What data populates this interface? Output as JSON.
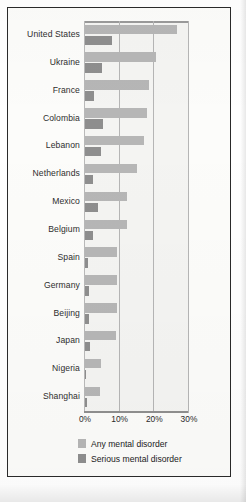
{
  "chart_data": {
    "type": "bar",
    "orientation": "horizontal",
    "title": "",
    "xlabel": "",
    "ylabel": "",
    "xlim": [
      0,
      30
    ],
    "xticks": [
      "0%",
      "10%",
      "20%",
      "30%"
    ],
    "xtick_values": [
      0,
      10,
      20,
      30
    ],
    "grid": true,
    "legend_position": "bottom",
    "categories": [
      "United States",
      "Ukraine",
      "France",
      "Colombia",
      "Lebanon",
      "Netherlands",
      "Mexico",
      "Belgium",
      "Spain",
      "Germany",
      "Beijing",
      "Japan",
      "Nigeria",
      "Shanghai"
    ],
    "series": [
      {
        "name": "Any mental disorder",
        "color": "#b6b6b6",
        "values": [
          26.4,
          20.5,
          18.4,
          17.8,
          16.9,
          14.9,
          12.2,
          12.0,
          9.2,
          9.1,
          9.1,
          8.8,
          4.7,
          4.3
        ]
      },
      {
        "name": "Serious mental disorder",
        "color": "#8e8e8e",
        "values": [
          7.7,
          4.8,
          2.7,
          5.2,
          4.6,
          2.3,
          3.7,
          2.4,
          1.0,
          1.2,
          1.1,
          1.5,
          0.4,
          0.7
        ]
      }
    ]
  },
  "legend": {
    "items": [
      {
        "label": "Any mental disorder",
        "color": "#b6b6b6"
      },
      {
        "label": "Serious mental disorder",
        "color": "#8e8e8e"
      }
    ]
  }
}
